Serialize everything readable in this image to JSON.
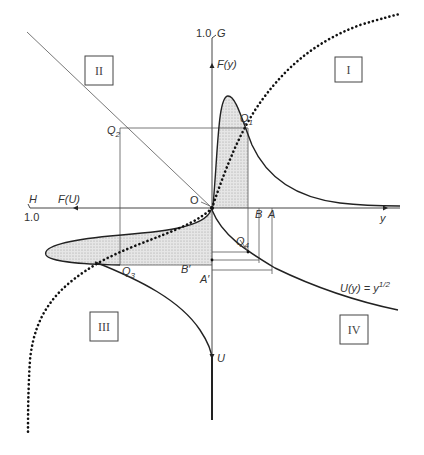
{
  "diagram": {
    "axes": {
      "top_label": "G",
      "top_value": "1.0",
      "vertical_mid_label": "F(y)",
      "bottom_label": "U",
      "left_label": "H",
      "left_value": "1.0",
      "horizontal_mid_label": "F(U)",
      "right_label": "y",
      "origin_label": "O"
    },
    "quadrants": {
      "q1": "I",
      "q2": "II",
      "q3": "III",
      "q4": "IV"
    },
    "points": {
      "q1": "Q",
      "q1_sub": "1",
      "q2": "Q",
      "q2_sub": "2",
      "q3": "Q",
      "q3_sub": "3",
      "q4": "Q",
      "q4_sub": "4",
      "b": "B",
      "a": "A",
      "b_prime": "B′",
      "a_prime": "A′"
    },
    "function_label": {
      "base": "U(y) = y",
      "exponent": "1/2"
    }
  }
}
